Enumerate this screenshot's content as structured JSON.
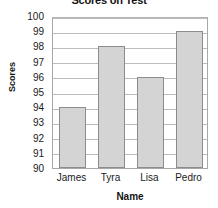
{
  "chart_data": {
    "type": "bar",
    "title": "Scores on Test",
    "xlabel": "Name",
    "ylabel": "Scores",
    "categories": [
      "James",
      "Tyra",
      "Lisa",
      "Pedro"
    ],
    "values": [
      94,
      98,
      96,
      99
    ],
    "ylim": [
      90,
      100
    ],
    "ytick_step": 1,
    "yticks": [
      100,
      99,
      98,
      97,
      96,
      95,
      94,
      93,
      92,
      91,
      90
    ],
    "grid": true,
    "legend": "none",
    "colors": {
      "bar_fill": "#d4d4d4",
      "bar_border": "#8c8c8c",
      "gridline": "#bcbcbc",
      "axis": "#a8a8a8",
      "text": "#1a1a1a",
      "background": "#ffffff"
    }
  }
}
